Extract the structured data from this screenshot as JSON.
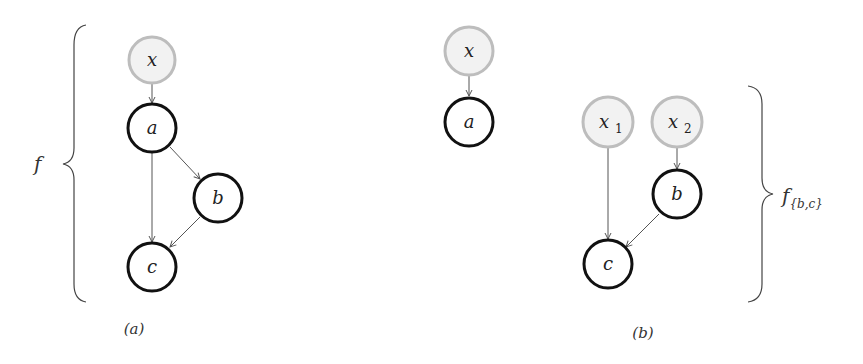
{
  "colors": {
    "observed_fill": "#f2f2f2",
    "observed_stroke": "#bdbdbd",
    "latent_stroke": "#111111",
    "edge": "#555555"
  },
  "panels": [
    {
      "caption": "(a)",
      "brace_label": "f",
      "nodes": [
        {
          "id": "x",
          "label": "x",
          "type": "observed"
        },
        {
          "id": "a",
          "label": "a",
          "type": "latent"
        },
        {
          "id": "b",
          "label": "b",
          "type": "latent"
        },
        {
          "id": "c",
          "label": "c",
          "type": "latent"
        }
      ],
      "edges": [
        [
          "x",
          "a"
        ],
        [
          "a",
          "c"
        ],
        [
          "a",
          "b"
        ],
        [
          "b",
          "c"
        ]
      ]
    },
    {
      "caption": "(b)",
      "brace_label": "f",
      "brace_subscript": "{b,c}",
      "nodes": [
        {
          "id": "x",
          "label": "x",
          "type": "observed"
        },
        {
          "id": "a",
          "label": "a",
          "type": "latent"
        },
        {
          "id": "x1",
          "label": "x",
          "sub": "1",
          "type": "observed"
        },
        {
          "id": "x2",
          "label": "x",
          "sub": "2",
          "type": "observed"
        },
        {
          "id": "b",
          "label": "b",
          "type": "latent"
        },
        {
          "id": "c",
          "label": "c",
          "type": "latent"
        }
      ],
      "edges": [
        [
          "x",
          "a"
        ],
        [
          "x1",
          "c"
        ],
        [
          "x2",
          "b"
        ],
        [
          "b",
          "c"
        ]
      ]
    }
  ]
}
